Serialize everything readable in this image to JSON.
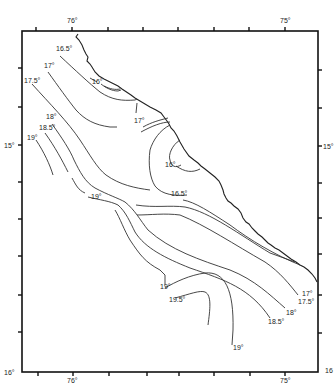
{
  "map": {
    "type": "isotherm contour map",
    "axes": {
      "top_labels": [
        {
          "text": "76°",
          "x": 73
        },
        {
          "text": "75°",
          "x": 285
        }
      ],
      "bottom_labels": [
        {
          "text": "76°",
          "x": 73
        },
        {
          "text": "75°",
          "x": 285
        }
      ],
      "left_labels": [
        {
          "text": "15°",
          "y": 147
        },
        {
          "text": "16°",
          "y": 372
        }
      ],
      "right_labels": [
        {
          "text": "15°",
          "y": 147
        },
        {
          "text": "16",
          "y": 370
        }
      ]
    },
    "isotherm_labels": [
      {
        "text": "16.5°",
        "x": 56,
        "y": 51
      },
      {
        "text": "17°",
        "x": 44,
        "y": 68
      },
      {
        "text": "17.5°",
        "x": 24,
        "y": 83
      },
      {
        "text": "16°",
        "x": 92,
        "y": 84
      },
      {
        "text": "17°",
        "x": 134,
        "y": 123
      },
      {
        "text": "18°",
        "x": 46,
        "y": 119
      },
      {
        "text": "18.5°",
        "x": 39,
        "y": 130
      },
      {
        "text": "19°",
        "x": 27,
        "y": 140
      },
      {
        "text": "16°",
        "x": 165,
        "y": 167
      },
      {
        "text": "16.5°",
        "x": 171,
        "y": 196
      },
      {
        "text": "19°",
        "x": 91,
        "y": 199
      },
      {
        "text": "19°",
        "x": 160,
        "y": 289
      },
      {
        "text": "19.5°",
        "x": 169,
        "y": 302
      },
      {
        "text": "17°",
        "x": 302,
        "y": 296
      },
      {
        "text": "17.5°",
        "x": 298,
        "y": 304
      },
      {
        "text": "18°",
        "x": 286,
        "y": 315
      },
      {
        "text": "18.5°",
        "x": 268,
        "y": 324
      },
      {
        "text": "19°",
        "x": 233,
        "y": 350
      }
    ]
  }
}
